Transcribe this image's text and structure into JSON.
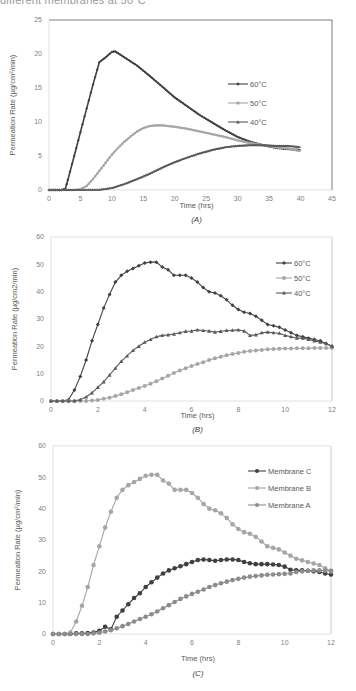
{
  "header": {
    "cut_text": "different membranes at 50°C"
  },
  "colors": {
    "dark": "#404040",
    "mid_gray": "#a6a6a6",
    "gray": "#8c8c8c",
    "axis": "#bfbfbf",
    "frame": "#7f7f7f"
  },
  "chart_data": [
    {
      "id": "A",
      "type": "line",
      "panel_label": "(A)",
      "title": "",
      "xlabel": "Time (hrs)",
      "ylabel": "Permeation Rate  (µg/cm²/min)",
      "xlim": [
        0,
        45
      ],
      "ylim": [
        0,
        25
      ],
      "xticks": [
        0,
        5,
        10,
        15,
        20,
        25,
        30,
        35,
        40,
        45
      ],
      "yticks": [
        0,
        5,
        10,
        15,
        20,
        25
      ],
      "legend_position": "right-middle",
      "series": [
        {
          "name": "60°C",
          "marker": "diamond",
          "color": "#404040",
          "x": [
            0,
            2,
            2.6,
            3,
            4,
            5,
            6,
            7,
            8,
            9,
            10,
            10.5,
            11,
            12,
            14,
            16,
            18,
            20,
            22,
            24,
            26,
            28,
            30,
            32,
            34,
            36,
            38,
            40
          ],
          "y": [
            0,
            0,
            0.2,
            1.5,
            5,
            8.5,
            12,
            15.5,
            18.8,
            19.5,
            20.3,
            20.4,
            20.1,
            19.5,
            18.3,
            16.8,
            15.2,
            13.6,
            12.3,
            11.0,
            9.9,
            8.8,
            7.8,
            7.1,
            6.6,
            6.2,
            6.0,
            5.9
          ]
        },
        {
          "name": "50°C",
          "marker": "square",
          "color": "#a6a6a6",
          "x": [
            0,
            4,
            5,
            6,
            7,
            8,
            9,
            10,
            11,
            12,
            13,
            14,
            15,
            16,
            17,
            18,
            19,
            20,
            22,
            24,
            26,
            28,
            30,
            32,
            34,
            36,
            38,
            40
          ],
          "y": [
            0,
            0,
            0.1,
            0.6,
            1.6,
            2.8,
            4.0,
            5.2,
            6.2,
            7.1,
            7.9,
            8.6,
            9.1,
            9.4,
            9.5,
            9.5,
            9.4,
            9.3,
            9.0,
            8.6,
            8.2,
            7.8,
            7.3,
            6.9,
            6.6,
            6.3,
            6.1,
            5.7
          ]
        },
        {
          "name": "40°C",
          "marker": "triangle",
          "color": "#595959",
          "x": [
            0,
            8,
            10,
            12,
            14,
            16,
            18,
            20,
            22,
            24,
            26,
            28,
            30,
            32,
            34,
            36,
            38,
            40
          ],
          "y": [
            0,
            0.05,
            0.3,
            0.9,
            1.6,
            2.4,
            3.3,
            4.1,
            4.8,
            5.4,
            5.9,
            6.3,
            6.5,
            6.6,
            6.6,
            6.5,
            6.5,
            6.3
          ]
        }
      ]
    },
    {
      "id": "B",
      "type": "line",
      "panel_label": "(B)",
      "title": "",
      "xlabel": "Time (hrs)",
      "ylabel": "Permeation Rate  (µg/cm2/min)",
      "xlim": [
        0,
        12
      ],
      "ylim": [
        0,
        60
      ],
      "xticks": [
        0,
        2,
        4,
        6,
        8,
        10,
        12
      ],
      "yticks": [
        0,
        10,
        20,
        30,
        40,
        50,
        60
      ],
      "legend_position": "top-right",
      "series": [
        {
          "name": "60°C",
          "marker": "diamond",
          "color": "#404040",
          "x": [
            0,
            0.25,
            0.5,
            0.75,
            1.0,
            1.25,
            1.5,
            1.75,
            2.0,
            2.25,
            2.5,
            2.75,
            3.0,
            3.25,
            3.5,
            3.75,
            4.0,
            4.25,
            4.5,
            4.75,
            5.0,
            5.25,
            5.5,
            5.75,
            6.0,
            6.25,
            6.5,
            6.75,
            7.0,
            7.25,
            7.5,
            7.75,
            8.0,
            8.25,
            8.5,
            8.75,
            9.0,
            9.25,
            9.5,
            9.75,
            10.0,
            10.25,
            10.5,
            10.75,
            11.0,
            11.25,
            11.5,
            11.75,
            12.0
          ],
          "y": [
            0,
            0,
            0,
            0.5,
            4,
            9,
            15,
            22,
            28,
            34,
            39,
            43.5,
            46,
            47.5,
            48.5,
            49.5,
            50.5,
            50.8,
            50.8,
            49,
            48,
            46,
            46,
            46,
            45,
            43.5,
            41.5,
            40,
            39.5,
            38.5,
            37,
            35,
            33.5,
            32.5,
            32,
            31,
            29.5,
            28,
            27.5,
            27,
            26,
            25,
            24,
            23.5,
            23,
            22.5,
            22,
            21,
            20
          ]
        },
        {
          "name": "50°C",
          "marker": "circle",
          "color": "#a6a6a6",
          "x": [
            0,
            0.25,
            0.5,
            0.75,
            1.0,
            1.25,
            1.5,
            1.75,
            2.0,
            2.25,
            2.5,
            2.75,
            3.0,
            3.25,
            3.5,
            3.75,
            4.0,
            4.25,
            4.5,
            4.75,
            5.0,
            5.25,
            5.5,
            5.75,
            6.0,
            6.25,
            6.5,
            6.75,
            7.0,
            7.25,
            7.5,
            7.75,
            8.0,
            8.25,
            8.5,
            8.75,
            9.0,
            9.25,
            9.5,
            9.75,
            10.0,
            10.25,
            10.5,
            10.75,
            11.0,
            11.25,
            11.5,
            11.75,
            12.0
          ],
          "y": [
            0,
            0,
            0,
            0,
            0,
            0,
            0,
            0.2,
            0.4,
            0.8,
            1.2,
            1.8,
            2.5,
            3.2,
            4,
            4.8,
            5.5,
            6.3,
            7.2,
            8.2,
            9.2,
            10.2,
            11.2,
            12,
            12.8,
            13.5,
            14.2,
            15,
            15.6,
            16.2,
            16.7,
            17.2,
            17.6,
            18,
            18.3,
            18.5,
            18.7,
            18.9,
            19,
            19.1,
            19.2,
            19.2,
            19.3,
            19.3,
            19.3,
            19.4,
            19.4,
            19.4,
            19.4
          ]
        },
        {
          "name": "40°C",
          "marker": "triangle",
          "color": "#595959",
          "x": [
            0,
            0.25,
            0.5,
            0.75,
            1.0,
            1.25,
            1.5,
            1.75,
            2.0,
            2.25,
            2.5,
            2.75,
            3.0,
            3.25,
            3.5,
            3.75,
            4.0,
            4.25,
            4.5,
            4.75,
            5.0,
            5.25,
            5.5,
            5.75,
            6.0,
            6.25,
            6.5,
            6.75,
            7.0,
            7.25,
            7.5,
            7.75,
            8.0,
            8.25,
            8.5,
            8.75,
            9.0,
            9.25,
            9.5,
            9.75,
            10.0,
            10.25,
            10.5,
            10.75,
            11.0,
            11.25,
            11.5,
            11.75,
            12.0
          ],
          "y": [
            0,
            0,
            0,
            0,
            0,
            0.5,
            1.5,
            3,
            5,
            7,
            9.5,
            12,
            14.5,
            16.5,
            18.5,
            20,
            21.5,
            22.5,
            23.5,
            24,
            24.2,
            24.5,
            25,
            25.5,
            25.6,
            26,
            25.8,
            25.6,
            25.2,
            25.5,
            25.8,
            25.9,
            26,
            25.6,
            24,
            24.2,
            25,
            25.2,
            25,
            24.8,
            24,
            23.5,
            23,
            23,
            22.5,
            22,
            21.5,
            21,
            20
          ]
        }
      ]
    },
    {
      "id": "C",
      "type": "line",
      "panel_label": "(C)",
      "title": "",
      "xlabel": "Time (hrs)",
      "ylabel": "Permeation Rate  (µg/cm²/min)",
      "xlim": [
        0,
        12
      ],
      "ylim": [
        0,
        60
      ],
      "xticks": [
        0,
        2,
        4,
        6,
        8,
        10,
        12
      ],
      "yticks": [
        0,
        10,
        20,
        30,
        40,
        50,
        60
      ],
      "legend_position": "top-right",
      "series": [
        {
          "name": "Membrane C",
          "marker": "circle",
          "color": "#404040",
          "x": [
            0,
            0.25,
            0.5,
            0.75,
            1.0,
            1.25,
            1.5,
            1.75,
            2.0,
            2.25,
            2.5,
            2.75,
            3.0,
            3.25,
            3.5,
            3.75,
            4.0,
            4.25,
            4.5,
            4.75,
            5.0,
            5.25,
            5.5,
            5.75,
            6.0,
            6.25,
            6.5,
            6.75,
            7.0,
            7.25,
            7.5,
            7.75,
            8.0,
            8.25,
            8.5,
            8.75,
            9.0,
            9.25,
            9.5,
            9.75,
            10.0,
            10.25,
            10.5,
            10.75,
            11.0,
            11.25,
            11.5,
            11.75,
            12.0
          ],
          "y": [
            0,
            0,
            0,
            0,
            0.2,
            0.2,
            0.3,
            0.5,
            1,
            2.3,
            1.5,
            5.5,
            7.5,
            9.5,
            11.5,
            13,
            15,
            16.5,
            18,
            19.3,
            20.3,
            21,
            21.6,
            22.3,
            23,
            23.6,
            23.8,
            23.6,
            23.4,
            23.6,
            23.8,
            23.8,
            23.6,
            23,
            22.6,
            22.3,
            22.3,
            22.3,
            22.2,
            22,
            21.5,
            20.5,
            20.3,
            20.3,
            20.2,
            20,
            19.8,
            19.3,
            19
          ]
        },
        {
          "name": "Membrane B",
          "marker": "circle",
          "color": "#a6a6a6",
          "x": [
            0,
            0.25,
            0.5,
            0.75,
            1.0,
            1.25,
            1.5,
            1.75,
            2.0,
            2.25,
            2.5,
            2.75,
            3.0,
            3.25,
            3.5,
            3.75,
            4.0,
            4.25,
            4.5,
            4.75,
            5.0,
            5.25,
            5.5,
            5.75,
            6.0,
            6.25,
            6.5,
            6.75,
            7.0,
            7.25,
            7.5,
            7.75,
            8.0,
            8.25,
            8.5,
            8.75,
            9.0,
            9.25,
            9.5,
            9.75,
            10.0,
            10.25,
            10.5,
            10.75,
            11.0,
            11.25,
            11.5,
            11.75,
            12.0
          ],
          "y": [
            0,
            0,
            0,
            0.5,
            4,
            9,
            15,
            22,
            28,
            34,
            39,
            43.5,
            46,
            47.5,
            48.5,
            49.5,
            50.5,
            50.8,
            50.8,
            49,
            48,
            46,
            46,
            46,
            45,
            43.5,
            41.5,
            40,
            39.5,
            38.5,
            37,
            35,
            33.5,
            32.5,
            32,
            31,
            29.5,
            28,
            27.5,
            27,
            26,
            25,
            24,
            23.5,
            23,
            22.5,
            22,
            21,
            20
          ]
        },
        {
          "name": "Membrane A",
          "marker": "circle",
          "color": "#8c8c8c",
          "x": [
            0,
            0.25,
            0.5,
            0.75,
            1.0,
            1.25,
            1.5,
            1.75,
            2.0,
            2.25,
            2.5,
            2.75,
            3.0,
            3.25,
            3.5,
            3.75,
            4.0,
            4.25,
            4.5,
            4.75,
            5.0,
            5.25,
            5.5,
            5.75,
            6.0,
            6.25,
            6.5,
            6.75,
            7.0,
            7.25,
            7.5,
            7.75,
            8.0,
            8.25,
            8.5,
            8.75,
            9.0,
            9.25,
            9.5,
            9.75,
            10.0,
            10.25,
            10.5,
            10.75,
            11.0,
            11.25,
            11.5,
            11.75,
            12.0
          ],
          "y": [
            0,
            0,
            0,
            0,
            0,
            0,
            0,
            0.2,
            0.4,
            0.8,
            1.2,
            1.8,
            2.5,
            3.2,
            4,
            4.8,
            5.5,
            6.3,
            7.2,
            8.2,
            9.2,
            10.2,
            11.2,
            12,
            12.8,
            13.5,
            14.2,
            15,
            15.6,
            16.2,
            16.7,
            17.2,
            17.6,
            18,
            18.3,
            18.5,
            18.7,
            18.9,
            19,
            19.1,
            19.2,
            19.3,
            19.8,
            20,
            20.2,
            20.3,
            20.3,
            20.2,
            20.2
          ]
        }
      ]
    }
  ]
}
